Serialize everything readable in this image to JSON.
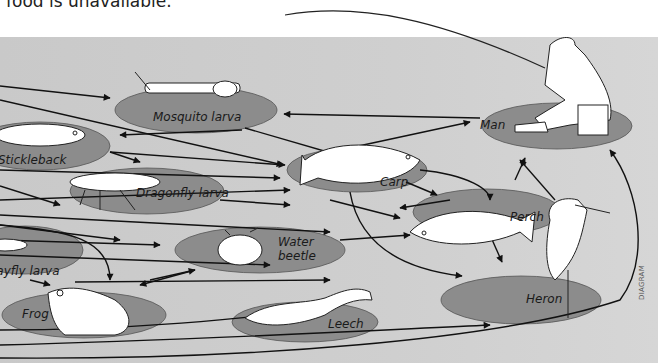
{
  "caption": "food is unavailable.",
  "watermark": "DIAGRAM",
  "colors": {
    "background": "#cccccc",
    "node_fill": "#8c8c8c",
    "arrow": "#111111",
    "organism": "#ffffff"
  },
  "nodes": [
    {
      "id": "mosquito",
      "label": "Mosquito larva"
    },
    {
      "id": "stickleback",
      "label": "Stickleback"
    },
    {
      "id": "dragonfly",
      "label": "Dragonfly larva"
    },
    {
      "id": "mayfly",
      "label": "Mayfly larva"
    },
    {
      "id": "frog",
      "label": "Frog"
    },
    {
      "id": "beetle",
      "label_line1": "Water",
      "label_line2": "beetle"
    },
    {
      "id": "leech",
      "label": "Leech"
    },
    {
      "id": "carp",
      "label": "Carp"
    },
    {
      "id": "perch",
      "label": "Perch"
    },
    {
      "id": "heron",
      "label": "Heron"
    },
    {
      "id": "man",
      "label": "Man"
    }
  ]
}
